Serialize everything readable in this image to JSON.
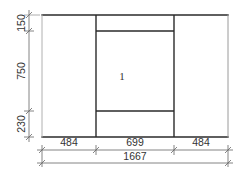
{
  "drawing": {
    "type": "window-elevation",
    "colors": {
      "frame_line": "#2a2a2a",
      "outer_right_line": "#9a9a9a",
      "dimension_line": "#666666",
      "text": "#333333",
      "background": "#ffffff"
    },
    "panel_label": "1",
    "vertical_dimensions": [
      {
        "label": "150",
        "from_y": 15,
        "to_y": 31
      },
      {
        "label": "750",
        "from_y": 31,
        "to_y": 111
      },
      {
        "label": "230",
        "from_y": 111,
        "to_y": 137
      }
    ],
    "horizontal_dimensions": [
      {
        "label": "484",
        "from_x": 42,
        "to_x": 96
      },
      {
        "label": "699",
        "from_x": 96,
        "to_x": 174
      },
      {
        "label": "484",
        "from_x": 174,
        "to_x": 228
      }
    ],
    "overall_width": {
      "label": "1667",
      "from_x": 42,
      "to_x": 228
    }
  }
}
